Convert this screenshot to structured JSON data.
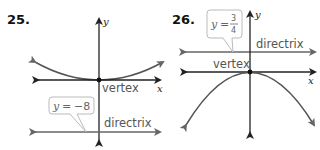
{
  "problems": [
    {
      "number": "25.",
      "axis_labels": {
        "x": "x",
        "y": "y"
      },
      "vertex_label": "vertex",
      "directrix_label": "directrix",
      "callout": {
        "variable": "y",
        "equals": "=",
        "value": "−8"
      },
      "parabola_opens": "up"
    },
    {
      "number": "26.",
      "axis_labels": {
        "x": "x",
        "y": "y"
      },
      "vertex_label": "vertex",
      "directrix_label": "directrix",
      "callout": {
        "variable": "y",
        "equals": "=",
        "numerator": "3",
        "denominator": "4"
      },
      "parabola_opens": "down"
    }
  ],
  "colors": {
    "axis": "#222222",
    "curve": "#555555",
    "directrix": "#666666",
    "label": "#555555",
    "callout_border": "#bbbbbb"
  }
}
